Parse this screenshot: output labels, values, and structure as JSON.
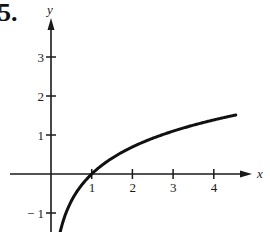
{
  "problem_number": "5.",
  "chart_data": {
    "type": "line",
    "title": "",
    "function": "y = ln(x)",
    "xlabel": "x",
    "ylabel": "y",
    "x_ticks": [
      1,
      2,
      3,
      4
    ],
    "y_ticks": [
      -1,
      1,
      2,
      3
    ],
    "x_tick_labels": [
      "1",
      "2",
      "3",
      "4"
    ],
    "y_tick_labels": [
      "− 1",
      "1",
      "2",
      "3"
    ],
    "xlim": [
      -0.5,
      4.8
    ],
    "ylim": [
      -1.5,
      3.9
    ],
    "grid": false,
    "legend": null,
    "series": [
      {
        "name": "curve",
        "x": [
          0.2,
          0.3,
          0.5,
          0.75,
          1,
          1.5,
          2,
          2.5,
          3,
          3.5,
          4,
          4.5
        ],
        "values": [
          -1.61,
          -1.2,
          -0.69,
          -0.29,
          0,
          0.41,
          0.69,
          0.92,
          1.1,
          1.25,
          1.39,
          1.5
        ]
      }
    ],
    "annotations": [
      "curve crosses x-axis at (1, 0)"
    ]
  }
}
